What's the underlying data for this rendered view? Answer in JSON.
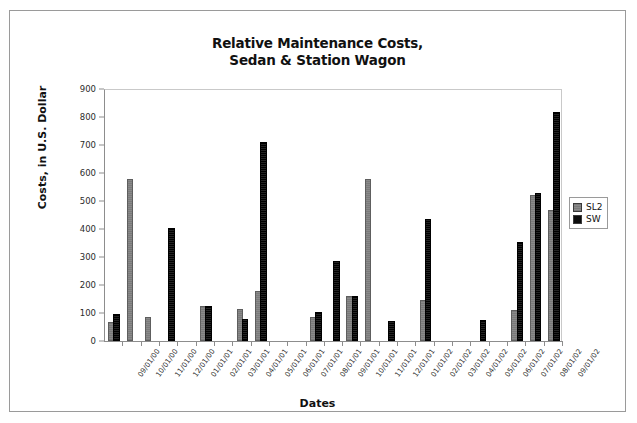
{
  "chart_data": {
    "type": "bar",
    "title": "Relative Maintenance Costs, Sedan & Station Wagon",
    "title_line1": "Relative Maintenance Costs,",
    "title_line2": "Sedan & Station Wagon",
    "xlabel": "Dates",
    "ylabel": "Costs, in U.S. Dollar",
    "ylim": [
      0,
      900
    ],
    "yticks": [
      0,
      100,
      200,
      300,
      400,
      500,
      600,
      700,
      800,
      900
    ],
    "grid": false,
    "legend_position": "right",
    "categories": [
      "09/01/00",
      "10/01/00",
      "11/01/00",
      "12/01/00",
      "01/01/01",
      "02/01/01",
      "03/01/01",
      "04/01/01",
      "05/01/01",
      "06/01/01",
      "07/01/01",
      "08/01/01",
      "09/01/01",
      "10/01/01",
      "11/01/01",
      "12/01/01",
      "01/01/02",
      "02/01/02",
      "03/01/02",
      "04/01/02",
      "05/01/02",
      "06/01/02",
      "07/01/02",
      "08/01/02",
      "09/01/02"
    ],
    "series": [
      {
        "name": "SL2",
        "color": "#808080",
        "values": [
          60,
          570,
          80,
          0,
          0,
          118,
          0,
          108,
          170,
          0,
          0,
          80,
          0,
          155,
          570,
          0,
          0,
          140,
          0,
          0,
          0,
          0,
          105,
          515,
          460
        ]
      },
      {
        "name": "SW",
        "color": "#0d0d0d",
        "values": [
          90,
          0,
          0,
          398,
          0,
          118,
          0,
          70,
          705,
          0,
          0,
          98,
          280,
          152,
          0,
          65,
          0,
          430,
          0,
          0,
          68,
          0,
          345,
          520,
          810
        ]
      }
    ]
  },
  "legend": {
    "items": [
      {
        "label": "SL2",
        "swatch": "sl2"
      },
      {
        "label": "SW",
        "swatch": "sw"
      }
    ]
  }
}
